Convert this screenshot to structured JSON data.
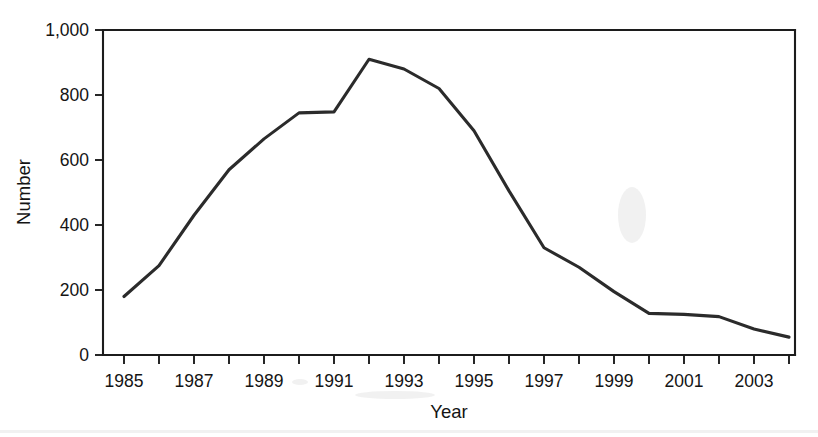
{
  "chart_data": {
    "type": "line",
    "title": "",
    "xlabel": "Year",
    "ylabel": "Number",
    "x": [
      1985,
      1986,
      1987,
      1988,
      1989,
      1990,
      1991,
      1992,
      1993,
      1994,
      1995,
      1996,
      1997,
      1998,
      1999,
      2000,
      2001,
      2002,
      2003,
      2004
    ],
    "values": [
      180,
      275,
      430,
      570,
      665,
      745,
      748,
      910,
      880,
      820,
      690,
      505,
      330,
      270,
      195,
      128,
      125,
      118,
      80,
      55
    ],
    "series": [
      {
        "name": "Number",
        "values": [
          180,
          275,
          430,
          570,
          665,
          745,
          748,
          910,
          880,
          820,
          690,
          505,
          330,
          270,
          195,
          128,
          125,
          118,
          80,
          55
        ]
      }
    ],
    "xlim": [
      1984.6,
      2004.4
    ],
    "ylim": [
      0,
      1000
    ],
    "y_ticks": [
      0,
      200,
      400,
      600,
      800,
      1000
    ],
    "y_tick_labels": [
      "0",
      "200",
      "400",
      "600",
      "800",
      "1,000"
    ],
    "x_ticks": [
      1985,
      1986,
      1987,
      1988,
      1989,
      1990,
      1991,
      1992,
      1993,
      1994,
      1995,
      1996,
      1997,
      1998,
      1999,
      2000,
      2001,
      2002,
      2003,
      2004
    ],
    "x_tick_labels": [
      "1985",
      "",
      "1987",
      "",
      "1989",
      "",
      "1991",
      "",
      "1993",
      "",
      "1995",
      "",
      "1997",
      "",
      "1999",
      "",
      "2001",
      "",
      "2003",
      ""
    ],
    "x_labeled_ticks": [
      {
        "value": 1985,
        "label": "1985"
      },
      {
        "value": 1987,
        "label": "1987"
      },
      {
        "value": 1989,
        "label": "1989"
      },
      {
        "value": 1991,
        "label": "1991"
      },
      {
        "value": 1993,
        "label": "1993"
      },
      {
        "value": 1995,
        "label": "1995"
      },
      {
        "value": 1997,
        "label": "1997"
      },
      {
        "value": 1999,
        "label": "1999"
      },
      {
        "value": 2001,
        "label": "2001"
      },
      {
        "value": 2003,
        "label": "2003"
      }
    ],
    "grid": false,
    "legend": false,
    "legend_position": "none",
    "line_color": "#2b2b2b",
    "background_color": "#ffffff",
    "axis_color": "#1c1c1c",
    "peak": {
      "x": 1992,
      "y": 910
    },
    "min": {
      "x": 2004,
      "y": 55
    }
  }
}
